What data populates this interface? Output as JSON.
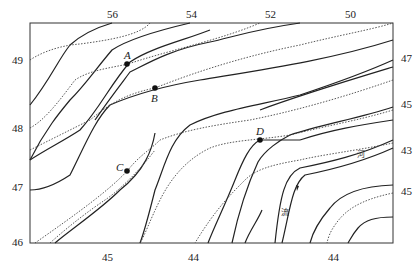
{
  "figure": {
    "type": "contour-isoline map",
    "solid_line_meaning": "contour lines",
    "dotted_line_meaning": "isolines"
  },
  "top_labels": [
    "56",
    "54",
    "52",
    "50"
  ],
  "left_labels": [
    "49",
    "48",
    "47",
    "46"
  ],
  "bottom_labels": [
    "45",
    "44",
    "44"
  ],
  "right_labels": [
    "47",
    "45",
    "43",
    "45"
  ],
  "points": [
    {
      "id": "A",
      "label": "A"
    },
    {
      "id": "B",
      "label": "B"
    },
    {
      "id": "C",
      "label": "C"
    },
    {
      "id": "D",
      "label": "D"
    }
  ],
  "river": {
    "label_upper": "河",
    "label_lower": "流"
  },
  "colors": {
    "line": "#222222",
    "background": "#ffffff"
  }
}
